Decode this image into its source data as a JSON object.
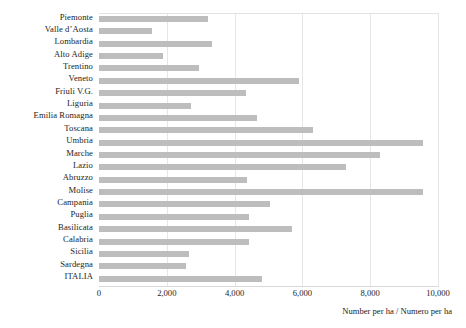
{
  "chart_data": {
    "type": "bar",
    "orientation": "horizontal",
    "title": "",
    "xlabel": "Number per ha / Numero per ha",
    "ylabel": "",
    "xlim": [
      0,
      10000
    ],
    "xticks": [
      "0",
      "2,000",
      "4,000",
      "6,000",
      "8,000",
      "10,000"
    ],
    "xtick_values": [
      0,
      2000,
      4000,
      6000,
      8000,
      10000
    ],
    "grid": "vertical",
    "legend": "none",
    "bar_color": "#bdbdbd",
    "categories": [
      "Piemonte",
      "Valle d’Aosta",
      "Lombardia",
      "Alto Adige",
      "Trentino",
      "Veneto",
      "Friuli V.G.",
      "Liguria",
      "Emilia Romagna",
      "Toscana",
      "Umbria",
      "Marche",
      "Lazio",
      "Abruzzo",
      "Molise",
      "Campania",
      "Puglia",
      "Basilicata",
      "Calabria",
      "Sicilia",
      "Sardegna",
      "ITALIA"
    ],
    "values": [
      3220,
      1560,
      3330,
      1890,
      2950,
      5900,
      4340,
      2720,
      4660,
      6320,
      9560,
      8290,
      7290,
      4370,
      9560,
      5050,
      4430,
      5690,
      4430,
      2660,
      2570,
      4810
    ]
  },
  "figure": {
    "corner_mark": "···"
  }
}
